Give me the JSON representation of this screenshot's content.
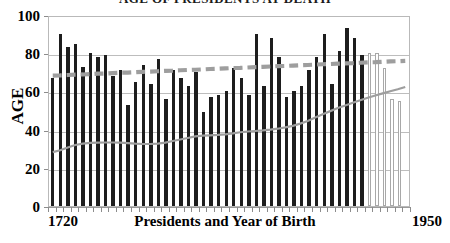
{
  "chart_data": {
    "type": "bar",
    "title": "AGE OF PRESIDENTS AT DEATH",
    "xlabel": "Presidents and Year of Birth",
    "ylabel": "AGE",
    "ylim": [
      0,
      100
    ],
    "yticks": [
      0,
      20,
      40,
      60,
      80,
      100
    ],
    "xlim_labels": [
      "1720",
      "1950"
    ],
    "grid": true,
    "legend": "none",
    "categories": [
      "1732",
      "1735",
      "1743",
      "1751",
      "1758",
      "1767",
      "1767",
      "1773",
      "1782",
      "1784",
      "1790",
      "1795",
      "1800",
      "1804",
      "1808",
      "1809",
      "1822",
      "1822",
      "1822",
      "1829",
      "1830",
      "1831",
      "1833",
      "1837",
      "1837",
      "1843",
      "1844",
      "1856",
      "1857",
      "1858",
      "1865",
      "1872",
      "1874",
      "1882",
      "1884",
      "1890",
      "1890",
      "1908",
      "1911",
      "1913",
      "1913",
      "1917",
      "1924",
      "1924",
      "1946",
      "1946",
      "1946",
      "1961"
    ],
    "series": [
      {
        "name": "Age at death",
        "kind": "bar",
        "style": "solid-dark",
        "values": [
          67,
          90,
          83,
          85,
          73,
          80,
          78,
          79,
          68,
          71,
          53,
          65,
          74,
          64,
          77,
          56,
          71,
          67,
          63,
          70,
          49,
          57,
          58,
          60,
          72,
          67,
          58,
          90,
          63,
          88,
          78,
          57,
          60,
          63,
          71,
          78,
          90,
          64,
          81,
          93,
          88,
          79,
          0,
          0,
          0,
          0,
          0,
          0
        ]
      },
      {
        "name": "Age of living presidents",
        "kind": "bar",
        "style": "hollow-outline",
        "values": [
          0,
          0,
          0,
          0,
          0,
          0,
          0,
          0,
          0,
          0,
          0,
          0,
          0,
          0,
          0,
          0,
          0,
          0,
          0,
          0,
          0,
          0,
          0,
          0,
          0,
          0,
          0,
          0,
          0,
          0,
          0,
          0,
          0,
          0,
          0,
          0,
          0,
          0,
          0,
          0,
          0,
          0,
          80,
          80,
          72,
          56,
          55,
          0
        ]
      },
      {
        "name": "Average age at death trend",
        "kind": "line",
        "style": "dashed-gray",
        "color": "#9e9e9e",
        "values": [
          69.0,
          69.1,
          69.3,
          69.5,
          69.6,
          69.8,
          70.0,
          70.1,
          70.3,
          70.5,
          70.6,
          70.8,
          71.0,
          71.1,
          71.3,
          71.5,
          71.6,
          71.8,
          72.0,
          72.1,
          72.3,
          72.5,
          72.6,
          72.8,
          73.0,
          73.1,
          73.3,
          73.5,
          73.6,
          73.8,
          74.0,
          74.1,
          74.3,
          74.5,
          74.6,
          74.8,
          75.0,
          75.1,
          75.3,
          75.5,
          75.6,
          75.8,
          76.0,
          76.1,
          76.3,
          76.5,
          76.6,
          76.8
        ]
      },
      {
        "name": "Life expectancy trend",
        "kind": "line",
        "style": "solid-gray",
        "color": "#9e9e9e",
        "values": [
          28.5,
          29.5,
          31.0,
          32.3,
          33.0,
          33.4,
          33.5,
          33.6,
          33.6,
          33.5,
          33.3,
          33.0,
          32.8,
          32.8,
          33.0,
          33.5,
          34.4,
          35.2,
          36.0,
          36.8,
          37.2,
          37.4,
          37.6,
          37.9,
          38.4,
          39.0,
          39.4,
          39.7,
          40.0,
          40.4,
          40.9,
          41.6,
          42.4,
          43.6,
          45.0,
          46.8,
          48.6,
          50.2,
          51.8,
          53.2,
          54.6,
          56.0,
          57.3,
          58.5,
          59.6,
          60.7,
          61.8,
          63.0
        ]
      }
    ]
  },
  "axes": {
    "y_tick_labels": [
      "100",
      "80",
      "60",
      "40",
      "20",
      "0"
    ],
    "x_left_label": "1720",
    "x_right_label": "1950",
    "x_title": "Presidents and Year of Birth",
    "y_title": "AGE"
  },
  "colors": {
    "bar_dark": "#1d1d1d",
    "bar_hollow_border": "#a8a8a8",
    "trend_dashed": "#9e9e9e",
    "trend_solid": "#9e9e9e",
    "gridline": "#bdbdbd",
    "frame": "#b9b9b9",
    "text": "#000000"
  }
}
